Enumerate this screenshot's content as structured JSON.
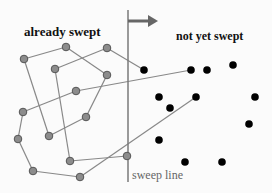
{
  "labels": {
    "already_swept": "already swept",
    "not_yet_swept": "not yet swept",
    "sweep_line": "sweep line"
  },
  "colors": {
    "background": "#fbfbfb",
    "swept_point_fill": "#8c8c8c",
    "swept_point_stroke": "#555555",
    "unswept_point": "#000000",
    "edge": "#888888",
    "sweep_line": "#7a7a7a",
    "arrow": "#666666"
  },
  "sweep_line": {
    "x": 128,
    "y_top": 10,
    "y_bottom": 182
  },
  "arrow": {
    "x1": 128,
    "x2": 158,
    "y": 21
  },
  "swept_points": [
    {
      "id": "A",
      "x": 24,
      "y": 59
    },
    {
      "id": "B",
      "x": 66,
      "y": 47
    },
    {
      "id": "C",
      "x": 107,
      "y": 48
    },
    {
      "id": "D",
      "x": 55,
      "y": 69
    },
    {
      "id": "E",
      "x": 107,
      "y": 75
    },
    {
      "id": "F",
      "x": 76,
      "y": 91
    },
    {
      "id": "G",
      "x": 23,
      "y": 112
    },
    {
      "id": "H",
      "x": 86,
      "y": 117
    },
    {
      "id": "I",
      "x": 18,
      "y": 139
    },
    {
      "id": "J",
      "x": 49,
      "y": 136
    },
    {
      "id": "K",
      "x": 70,
      "y": 161
    },
    {
      "id": "L",
      "x": 127,
      "y": 156
    },
    {
      "id": "M",
      "x": 33,
      "y": 171
    },
    {
      "id": "N",
      "x": 80,
      "y": 177
    }
  ],
  "unswept_points": [
    {
      "x": 144,
      "y": 70
    },
    {
      "x": 191,
      "y": 70
    },
    {
      "x": 207,
      "y": 70
    },
    {
      "x": 233,
      "y": 65
    },
    {
      "x": 159,
      "y": 97
    },
    {
      "x": 196,
      "y": 97
    },
    {
      "x": 255,
      "y": 97
    },
    {
      "x": 170,
      "y": 108
    },
    {
      "x": 249,
      "y": 124
    },
    {
      "x": 159,
      "y": 140
    },
    {
      "x": 185,
      "y": 162
    },
    {
      "x": 222,
      "y": 162
    }
  ],
  "edges": [
    [
      24,
      59,
      66,
      47
    ],
    [
      66,
      47,
      107,
      75
    ],
    [
      107,
      48,
      55,
      69
    ],
    [
      107,
      48,
      144,
      70
    ],
    [
      24,
      59,
      49,
      136
    ],
    [
      55,
      69,
      70,
      161
    ],
    [
      107,
      75,
      86,
      117
    ],
    [
      86,
      117,
      49,
      136
    ],
    [
      76,
      91,
      191,
      70
    ],
    [
      76,
      91,
      23,
      112
    ],
    [
      23,
      112,
      18,
      139
    ],
    [
      18,
      139,
      33,
      171
    ],
    [
      33,
      171,
      80,
      177
    ],
    [
      80,
      177,
      196,
      97
    ],
    [
      70,
      161,
      127,
      156
    ]
  ]
}
